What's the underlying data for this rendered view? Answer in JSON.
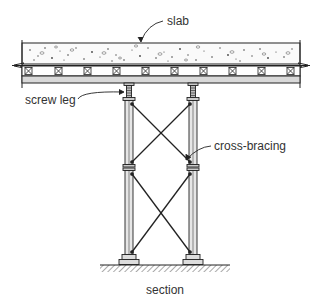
{
  "diagram": {
    "title": "section",
    "labels": {
      "slab": "slab",
      "screw_leg": "screw leg",
      "cross_bracing": "cross-bracing"
    },
    "components": [
      "slab",
      "joists",
      "beam",
      "screw leg",
      "shore legs",
      "cross-bracing",
      "base plates",
      "ground"
    ],
    "colors": {
      "line": "#222222",
      "beam_fill": "#d9d9d9",
      "leg_fill": "#e6e6e6",
      "text": "#333333"
    }
  }
}
